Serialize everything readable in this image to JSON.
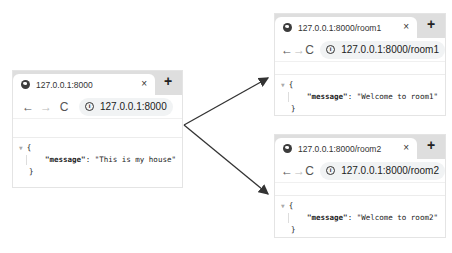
{
  "browsers": [
    {
      "id": "home",
      "tab_title": "127.0.0.1:8000",
      "url": "127.0.0.1:8000",
      "tab_close": "×",
      "new_tab": "+",
      "nav": {
        "back": "←",
        "forward": "→",
        "reload": "C"
      },
      "info_icon": "i",
      "json": {
        "open": "{",
        "key": "\"message\"",
        "sep": ": ",
        "value": "\"This is my house\"",
        "close": "}"
      }
    },
    {
      "id": "room1",
      "tab_title": "127.0.0.1:8000/room1",
      "url": "127.0.0.1:8000/room1",
      "tab_close": "×",
      "new_tab": "+",
      "nav": {
        "back": "←",
        "forward": "→",
        "reload": "C"
      },
      "info_icon": "i",
      "json": {
        "open": "{",
        "key": "\"message\"",
        "sep": ": ",
        "value": "\"Welcome to room1\"",
        "close": "}"
      }
    },
    {
      "id": "room2",
      "tab_title": "127.0.0.1:8000/room2",
      "url": "127.0.0.1:8000/room2",
      "tab_close": "×",
      "new_tab": "+",
      "nav": {
        "back": "←",
        "forward": "→",
        "reload": "C"
      },
      "info_icon": "i",
      "json": {
        "open": "{",
        "key": "\"message\"",
        "sep": ": ",
        "value": "\"Welcome to room2\"",
        "close": "}"
      }
    }
  ],
  "colors": {
    "tabstrip": "#dedede",
    "arrow": "#333333",
    "omnibox": "#f1f3f4"
  }
}
